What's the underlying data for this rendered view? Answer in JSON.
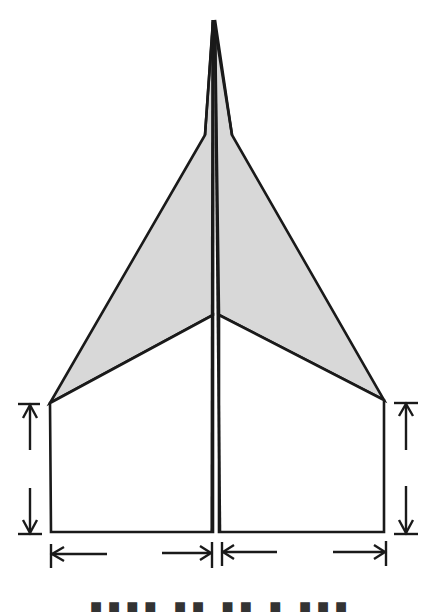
{
  "diagram": {
    "colors": {
      "outline": "#1a1a1a",
      "wing_fill": "#d8d8d8",
      "background": "#ffffff"
    },
    "parts": [
      {
        "name": "nose",
        "description": "pointed tip at top center"
      },
      {
        "name": "left-wing-folded",
        "description": "gray shaded triangular fold, left"
      },
      {
        "name": "right-wing-folded",
        "description": "gray shaded triangular fold, right"
      },
      {
        "name": "left-body-panel",
        "description": "white rectangular panel, left"
      },
      {
        "name": "right-body-panel",
        "description": "white rectangular panel, right"
      },
      {
        "name": "center-keel",
        "description": "double line down the center"
      }
    ],
    "dimension_arrows": [
      {
        "name": "left-height",
        "orientation": "vertical"
      },
      {
        "name": "right-height",
        "orientation": "vertical"
      },
      {
        "name": "left-width",
        "orientation": "horizontal"
      },
      {
        "name": "right-width",
        "orientation": "horizontal"
      }
    ]
  },
  "caption": {
    "text": "■■■■ ■■ ■■ ■ ■■■"
  }
}
